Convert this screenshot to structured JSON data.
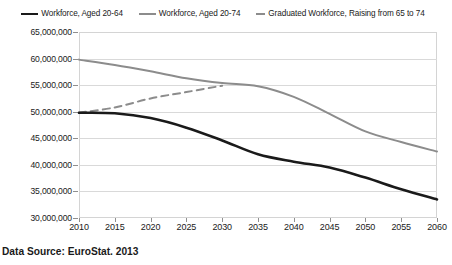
{
  "chart_data": {
    "type": "line",
    "title": "",
    "subtitle": "",
    "xlabel": "",
    "ylabel": "",
    "xlim": [
      2010,
      2060
    ],
    "ylim": [
      30000000,
      65000000
    ],
    "grid": true,
    "legend_position": "top",
    "x": [
      2010,
      2015,
      2020,
      2025,
      2030,
      2035,
      2040,
      2045,
      2050,
      2055,
      2060
    ],
    "x_tick_labels": [
      "2010",
      "2015",
      "2020",
      "2025",
      "2030",
      "2035",
      "2040",
      "2045",
      "2050",
      "2055",
      "2060"
    ],
    "y_tick_values": [
      30000000,
      35000000,
      40000000,
      45000000,
      50000000,
      55000000,
      60000000,
      65000000
    ],
    "y_tick_labels": [
      "30,000,000",
      "35,000,000",
      "40,000,000",
      "45,000,000",
      "50,000,000",
      "55,000,000",
      "60,000,000",
      "65,000,000"
    ],
    "series": [
      {
        "name": "Workforce, Aged 20-64",
        "style": "solid",
        "color": "#1a1a1a",
        "width": 2.6,
        "x": [
          2010,
          2015,
          2020,
          2025,
          2030,
          2035,
          2040,
          2045,
          2050,
          2055,
          2060
        ],
        "values": [
          49800000,
          49700000,
          48800000,
          47000000,
          44600000,
          42000000,
          40600000,
          39500000,
          37600000,
          35400000,
          33500000
        ]
      },
      {
        "name": "Workforce, Aged 20-74",
        "style": "solid",
        "color": "#8c8c8c",
        "width": 2.0,
        "x": [
          2010,
          2015,
          2020,
          2025,
          2030,
          2035,
          2040,
          2045,
          2050,
          2055,
          2060
        ],
        "values": [
          59800000,
          58800000,
          57600000,
          56300000,
          55400000,
          54800000,
          52800000,
          49600000,
          46300000,
          44300000,
          42500000
        ]
      },
      {
        "name": "Graduated Workforce, Raising from 65 to 74",
        "style": "dashed",
        "color": "#8c8c8c",
        "width": 2.0,
        "x": [
          2010,
          2015,
          2020,
          2025,
          2030
        ],
        "values": [
          49800000,
          50800000,
          52500000,
          53700000,
          54900000
        ]
      }
    ],
    "source_note": "Data Source: EuroStat. 2013"
  },
  "legend": {
    "items": [
      {
        "label": "Workforce, Aged 20-64",
        "swatch": "solid-dark"
      },
      {
        "label": "Workforce, Aged 20-74",
        "swatch": "solid-gray"
      },
      {
        "label": "Graduated Workforce, Raising from 65 to 74",
        "swatch": "dashed-gray"
      }
    ]
  },
  "footer": {
    "source": "Data Source: EuroStat. 2013"
  }
}
